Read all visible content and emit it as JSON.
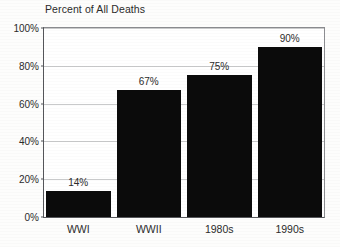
{
  "chart_data": {
    "type": "bar",
    "title": "Percent of All Deaths",
    "xlabel": "",
    "ylabel": "",
    "categories": [
      "WWI",
      "WWII",
      "1980s",
      "1990s"
    ],
    "values": [
      14,
      67,
      75,
      90
    ],
    "value_labels": [
      "14%",
      "67%",
      "75%",
      "90%"
    ],
    "ylim": [
      0,
      100
    ],
    "ytick_values": [
      0,
      20,
      40,
      60,
      80,
      100
    ],
    "ytick_labels": [
      "0%",
      "20%",
      "40%",
      "60%",
      "80%",
      "100%"
    ],
    "grid": true,
    "legend": "none",
    "bar_color": "#0b0b0b",
    "grid_color": "#c9cacb",
    "axis_color": "#55565a",
    "text_color": "#2b2b2b",
    "background_color": "#ffffff"
  }
}
